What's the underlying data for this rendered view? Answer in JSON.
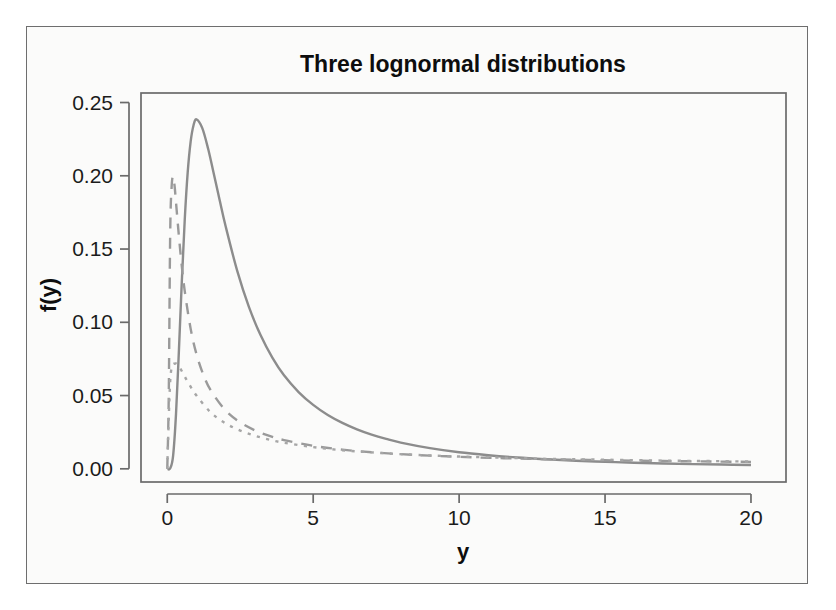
{
  "figure": {
    "background_color": "#fbfbfa",
    "frame_color": "#6e6e6e",
    "plot_area": {
      "left": 141,
      "top": 93,
      "right": 786,
      "bottom": 482
    }
  },
  "chart_data": {
    "type": "line",
    "title": "Three lognormal distributions",
    "subtitle": "",
    "xlabel": "y",
    "ylabel": "f(y)",
    "xlim": [
      -0.9,
      21.2
    ],
    "ylim": [
      -0.009,
      0.2565
    ],
    "grid": false,
    "legend": null,
    "legend_position": "none",
    "x_ticks": [
      0,
      5,
      10,
      15,
      20
    ],
    "x_tick_labels": [
      "0",
      "5",
      "10",
      "15",
      "20"
    ],
    "y_ticks": [
      0.0,
      0.05,
      0.1,
      0.15,
      0.2,
      0.25
    ],
    "y_tick_labels": [
      "0.00",
      "0.05",
      "0.10",
      "0.15",
      "0.20",
      "0.25"
    ],
    "annotations": [],
    "series": [
      {
        "name": "lognormal-solid",
        "style": "solid",
        "color": "#8c8c8c",
        "line_width": 2.4,
        "dash_pattern": "none",
        "peak_x": 1.0,
        "peak_y": 0.2415,
        "x": [
          0.0,
          0.1,
          0.2,
          0.3,
          0.4,
          0.5,
          0.6,
          0.7,
          0.8,
          0.9,
          1.0,
          1.2,
          1.4,
          1.6,
          1.8,
          2.0,
          2.4,
          2.8,
          3.2,
          3.6,
          4.0,
          4.5,
          5.0,
          5.5,
          6.0,
          6.5,
          7.0,
          7.5,
          8.0,
          9.0,
          10.0,
          11.0,
          12.0,
          13.0,
          14.0,
          15.0,
          16.0,
          17.0,
          18.0,
          19.0,
          20.0
        ],
        "y": [
          0.0,
          0.0003,
          0.0089,
          0.0375,
          0.0812,
          0.1286,
          0.1705,
          0.2023,
          0.2232,
          0.2345,
          0.2385,
          0.2325,
          0.2184,
          0.2009,
          0.1829,
          0.1655,
          0.1349,
          0.1103,
          0.0911,
          0.0759,
          0.0638,
          0.0524,
          0.0436,
          0.0367,
          0.0313,
          0.0269,
          0.0233,
          0.0204,
          0.0179,
          0.0141,
          0.0113,
          0.0093,
          0.0077,
          0.0065,
          0.0055,
          0.0048,
          0.0041,
          0.0036,
          0.0032,
          0.0029,
          0.0026
        ]
      },
      {
        "name": "lognormal-dashed",
        "style": "dashed",
        "color": "#9a9a9a",
        "line_width": 2.4,
        "dash_pattern": "11,9",
        "peak_x": 0.2,
        "peak_y": 0.1995,
        "x": [
          0.0,
          0.05,
          0.1,
          0.15,
          0.2,
          0.25,
          0.3,
          0.4,
          0.5,
          0.6,
          0.8,
          1.0,
          1.25,
          1.5,
          2.0,
          2.5,
          3.0,
          3.5,
          4.0,
          5.0,
          6.0,
          7.0,
          8.0,
          9.0,
          10.0,
          11.0,
          12.0,
          13.0,
          14.0,
          15.0,
          16.0,
          17.0,
          18.0,
          19.0,
          20.0
        ],
        "y": [
          0.0,
          0.0482,
          0.1606,
          0.1925,
          0.1995,
          0.1932,
          0.1818,
          0.1585,
          0.138,
          0.1211,
          0.0957,
          0.0783,
          0.0635,
          0.0532,
          0.0398,
          0.0317,
          0.0263,
          0.0225,
          0.0196,
          0.0157,
          0.0131,
          0.0113,
          0.01,
          0.009,
          0.0082,
          0.0075,
          0.007,
          0.0065,
          0.0062,
          0.0058,
          0.0056,
          0.0053,
          0.0051,
          0.0049,
          0.0047
        ]
      },
      {
        "name": "lognormal-dotted",
        "style": "dotted",
        "color": "#a6a6a6",
        "line_width": 2.4,
        "dash_pattern": "3.2,6.4",
        "peak_x": 0.32,
        "peak_y": 0.0719,
        "x": [
          0.0,
          0.05,
          0.1,
          0.15,
          0.2,
          0.3,
          0.35,
          0.4,
          0.5,
          0.7,
          1.0,
          1.5,
          2.0,
          2.5,
          3.0,
          3.5,
          4.0,
          5.0,
          6.0,
          7.0,
          8.0,
          9.0,
          10.0,
          11.0,
          12.0,
          13.0,
          14.0,
          15.0,
          16.0,
          17.0,
          18.0,
          19.0,
          20.0
        ],
        "y": [
          0.0,
          0.034,
          0.06,
          0.069,
          0.0714,
          0.0719,
          0.0712,
          0.07,
          0.0666,
          0.0594,
          0.05,
          0.0383,
          0.031,
          0.0261,
          0.0226,
          0.0199,
          0.0178,
          0.0148,
          0.0127,
          0.0112,
          0.01,
          0.0091,
          0.0084,
          0.0078,
          0.0073,
          0.0068,
          0.0065,
          0.0062,
          0.0059,
          0.0056,
          0.0054,
          0.0052,
          0.005
        ]
      }
    ]
  }
}
